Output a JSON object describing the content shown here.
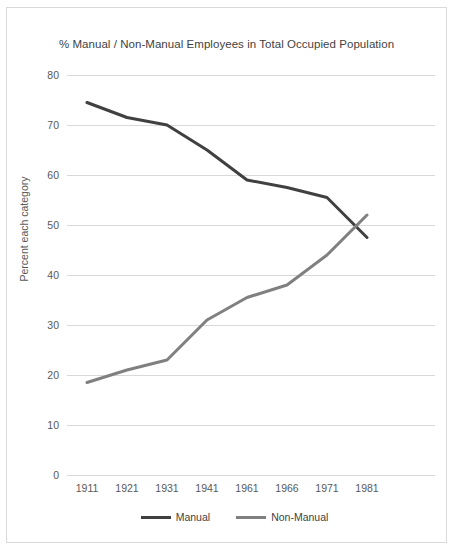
{
  "chart_data": {
    "type": "line",
    "title": "% Manual / Non-Manual Employees in Total Occupied Population",
    "xlabel": "",
    "ylabel": "Percent each category",
    "categories": [
      "1911",
      "1921",
      "1931",
      "1941",
      "1961",
      "1966",
      "1971",
      "1981"
    ],
    "ylim": [
      0,
      80
    ],
    "ytick_values": [
      80,
      70,
      60,
      50,
      40,
      30,
      20,
      10,
      0
    ],
    "ytick_labels": [
      "80",
      "70",
      "60",
      "50",
      "40",
      "30",
      "20",
      "10",
      "0"
    ],
    "grid": "horizontal",
    "legend_position": "bottom",
    "series": [
      {
        "name": "Manual",
        "color": "#404040",
        "values": [
          74.5,
          71.5,
          70,
          65,
          59,
          57.5,
          55.5,
          47.5
        ]
      },
      {
        "name": "Non-Manual",
        "color": "#808080",
        "values": [
          18.5,
          21,
          23,
          31,
          35.5,
          38,
          44,
          52
        ]
      }
    ]
  },
  "chart": {
    "title": "% Manual / Non-Manual Employees in Total Occupied Population",
    "y_axis_title": "Percent each category"
  },
  "legend": {
    "entries": [
      {
        "label": "Manual"
      },
      {
        "label": "Non-Manual"
      }
    ]
  },
  "colors": {
    "manual": "#404040",
    "non_manual": "#808080",
    "gridline": "#d9d9d9",
    "border": "#d9d9d9",
    "text": "#595959",
    "background": "#ffffff"
  }
}
